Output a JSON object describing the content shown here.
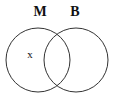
{
  "diagram": {
    "type": "venn",
    "sets": [
      {
        "label": "M",
        "cx": 38,
        "cy": 60,
        "r": 32,
        "label_x": 40,
        "label_y": 16
      },
      {
        "label": "B",
        "cx": 76,
        "cy": 60,
        "r": 32,
        "label_x": 75,
        "label_y": 16
      }
    ],
    "elements": [
      {
        "text": "x",
        "region": "M only",
        "x": 30,
        "y": 58
      }
    ],
    "stroke_color": "#333333",
    "background": "#ffffff"
  }
}
